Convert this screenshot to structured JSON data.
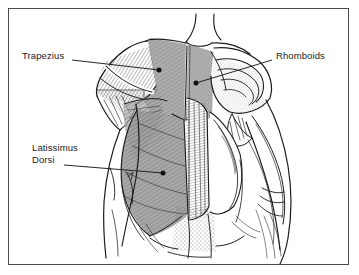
{
  "figure": {
    "background_color": "#ffffff",
    "line_color": "#1b1b1b",
    "shade_color": "#9a9a9a",
    "border_color": "#4a4a4a"
  },
  "labels": [
    {
      "id": "trapezius",
      "text": "Trapezius",
      "lines": [
        "Trapezius"
      ],
      "text_x": 22,
      "text_y": 50,
      "leader_from_x": 72,
      "leader_from_y": 60,
      "leader_to_x": 159,
      "leader_to_y": 70,
      "dot_x": 159,
      "dot_y": 70
    },
    {
      "id": "rhomboids",
      "text": "Rhomboids",
      "lines": [
        "Rhomboids"
      ],
      "text_x": 276,
      "text_y": 50,
      "leader_from_x": 272,
      "leader_from_y": 60,
      "leader_to_x": 196,
      "leader_to_y": 83,
      "dot_x": 196,
      "dot_y": 83
    },
    {
      "id": "latissimus-dorsi",
      "text": "Latissimus Dorsi",
      "lines": [
        "Latissimus",
        "Dorsi"
      ],
      "text_x": 32,
      "text_y": 142,
      "leader_from_x": 64,
      "leader_from_y": 165,
      "leader_to_x": 163,
      "leader_to_y": 173,
      "dot_x": 163,
      "dot_y": 173
    }
  ],
  "muscle_regions": [
    {
      "id": "trapezius-region",
      "name": "Trapezius",
      "shaded": true
    },
    {
      "id": "rhomboids-region",
      "name": "Rhomboids",
      "shaded": false
    },
    {
      "id": "latissimus-region",
      "name": "Latissimus Dorsi",
      "shaded": true
    },
    {
      "id": "left-deltoid",
      "name": "Left deltoid",
      "shaded": false
    },
    {
      "id": "right-deltoid",
      "name": "Right deltoid",
      "shaded": false
    },
    {
      "id": "erector-spinae",
      "name": "Erector spinae column",
      "shaded": false
    },
    {
      "id": "left-arm",
      "name": "Left arm",
      "shaded": false
    },
    {
      "id": "right-arm",
      "name": "Right arm",
      "shaded": false
    },
    {
      "id": "lower-back",
      "name": "Lower back",
      "shaded": true
    }
  ]
}
